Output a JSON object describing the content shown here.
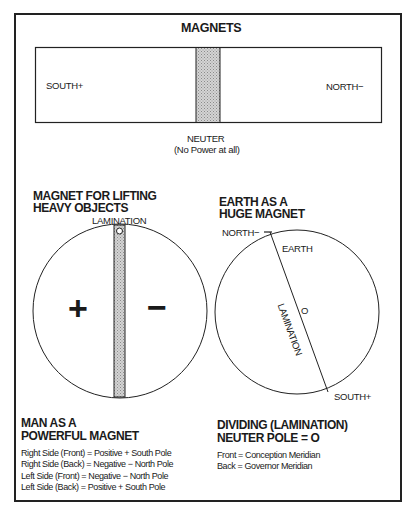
{
  "magnets": {
    "title": "MAGNETS",
    "south_label": "SOUTH+",
    "north_label": "NORTH−",
    "neuter_label": "NEUTER",
    "neuter_note": "(No Power at all)"
  },
  "lifting_magnet": {
    "heading_line1": "MAGNET FOR LIFTING",
    "heading_line2": "HEAVY OBJECTS",
    "lamination_label": "LAMINATION",
    "positive_sign": "+",
    "negative_sign": "−"
  },
  "earth_magnet": {
    "heading_line1": "EARTH AS A",
    "heading_line2": "HUGE MAGNET",
    "north_label": "NORTH−",
    "earth_label": "EARTH",
    "lamination_label": "LAMINATION",
    "lamination_marker": "O",
    "south_label": "SOUTH+"
  },
  "man_magnet": {
    "heading_line1": "MAN AS A",
    "heading_line2": "POWERFUL MAGNET",
    "lines": [
      "Right Side (Front) = Positive + South Pole",
      "Right Side (Back) = Negative − North Pole",
      "Left Side (Front) = Negative − North Pole",
      "Left Side (Back) = Positive + South Pole"
    ]
  },
  "dividing": {
    "heading_line1": "DIVIDING (LAMINATION)",
    "heading_line2": "NEUTER POLE = O",
    "lines": [
      "Front = Conception Meridian",
      "Back = Governor Meridian"
    ]
  },
  "colors": {
    "ink": "#1a1a1a",
    "neuter_fill": "#c8c8c8",
    "background": "#ffffff"
  }
}
